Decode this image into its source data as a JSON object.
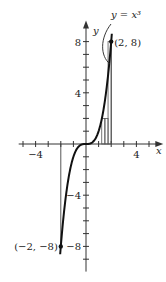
{
  "chart_data": {
    "type": "line",
    "title": "",
    "function": "y = x^3",
    "curve_label": "y = x³",
    "xlabel": "x",
    "ylabel": "y",
    "xlim": [
      -5.5,
      5.5
    ],
    "ylim": [
      -9.5,
      9.5
    ],
    "x_ticks": [
      -5,
      -4,
      -3,
      -2,
      -1,
      1,
      2,
      3,
      4,
      5
    ],
    "y_ticks": [
      -9,
      -8,
      -7,
      -6,
      -5,
      -4,
      -3,
      -2,
      -1,
      1,
      2,
      3,
      4,
      5,
      6,
      7,
      8
    ],
    "x_tick_labels": [
      {
        "value": -4,
        "text": "−4"
      },
      {
        "value": 4,
        "text": "4"
      }
    ],
    "y_tick_labels": [
      {
        "value": 8,
        "text": "8"
      },
      {
        "value": 4,
        "text": "4"
      },
      {
        "value": -4,
        "text": "−4"
      },
      {
        "value": -8,
        "text": "−8"
      }
    ],
    "curve_domain": [
      -2.05,
      2.05
    ],
    "points": [
      {
        "x": 2,
        "y": 8,
        "label": "(2, 8)"
      },
      {
        "x": -2,
        "y": -8,
        "label": "(−2, −8)"
      }
    ],
    "guide_lines": [
      {
        "x": -2,
        "y_from": 0,
        "y_to": -8
      },
      {
        "x": 2,
        "y_from": 0,
        "y_to": 8
      }
    ],
    "rectangles": [
      {
        "x0": 1.25,
        "x1": 1.5,
        "height": 2
      },
      {
        "x0": 1.5,
        "x1": 1.75,
        "height": 2
      },
      {
        "x0": 1.75,
        "x1": 2,
        "height": 8
      }
    ],
    "grid": false,
    "legend": "none"
  }
}
